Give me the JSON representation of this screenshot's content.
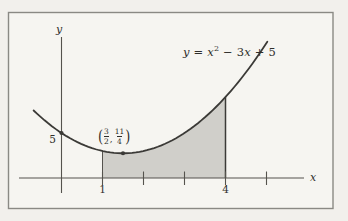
{
  "labels": {
    "equation": {
      "y": "y",
      "eq": " = ",
      "x1": "x",
      "sup": "2",
      "minus3": " − 3",
      "x2": "x",
      "plus5": " + 5"
    },
    "vertex": {
      "open": "(",
      "num1": "3",
      "den1": "2",
      "comma": ",",
      "num2": "11",
      "den2": "4",
      "close": ")"
    },
    "x_axis_letter": "x",
    "y_axis_letter": "y",
    "tick_1": "1",
    "tick_4": "4",
    "y_intercept": "5"
  },
  "chart_data": {
    "type": "area",
    "function": {
      "expression": "y = x^2 - 3x + 5",
      "a": 1,
      "b": -3,
      "c": 5
    },
    "x_drawn_range": [
      -0.68,
      5.02
    ],
    "shaded_interval": [
      1,
      4
    ],
    "x_axis_ticks": [
      1,
      2,
      3,
      4,
      5
    ],
    "x_axis_tick_labels_shown": [
      "1",
      "4"
    ],
    "y_axis_value_labeled": 5,
    "marked_points": [
      {
        "x": 0,
        "y": 5,
        "note": "y-intercept, labeled 5"
      },
      {
        "x": 1.5,
        "y": 2.75,
        "note": "vertex, labeled (3/2, 11/4)"
      }
    ],
    "grid": false,
    "legend": false,
    "colors": {
      "shade": "#d0cfca",
      "curve": "#3b3a37",
      "axis": "#55534e",
      "frame": "#8a8984",
      "paper_inside": "#f6f5f1",
      "paper_outside": "#f2f0ec"
    }
  }
}
